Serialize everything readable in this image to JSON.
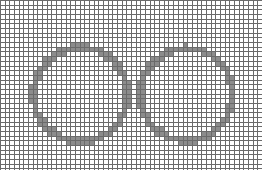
{
  "figure": {
    "grid": {
      "cols": 56,
      "rows": 36,
      "cell_px": 4.68,
      "line_color": "#6a6a6a",
      "background": "#ffffff"
    },
    "fill_color": "#8c8c8c",
    "rings": [
      {
        "name": "left-ring",
        "cx": 80,
        "cy": 94,
        "r": 47,
        "thickness": 6
      },
      {
        "name": "right-ring",
        "cx": 186,
        "cy": 94,
        "r": 46,
        "thickness": 6
      }
    ]
  }
}
